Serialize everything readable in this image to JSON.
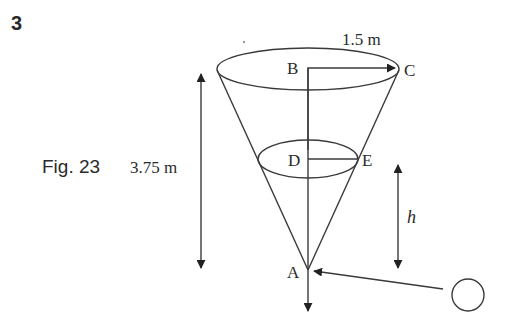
{
  "question_number": "3",
  "figure": {
    "caption": "Fig. 23",
    "labels": {
      "radius": "1.5 m",
      "height": "3.75 m",
      "h": "h",
      "B": "B",
      "C": "C",
      "D": "D",
      "E": "E",
      "A": "A"
    },
    "colors": {
      "line": "#3a3a3a",
      "text": "#2a2a2a",
      "background": "#ffffff"
    }
  }
}
